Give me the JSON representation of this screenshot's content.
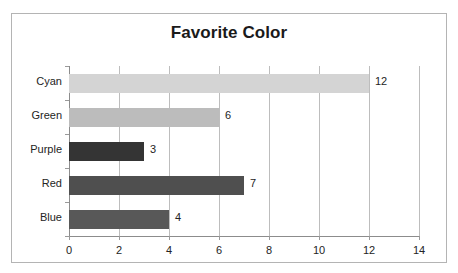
{
  "chart_data": {
    "type": "bar",
    "orientation": "horizontal",
    "title": "Favorite Color",
    "xlabel": "",
    "ylabel": "",
    "categories": [
      "Cyan",
      "Green",
      "Purple",
      "Red",
      "Blue"
    ],
    "values": [
      12,
      6,
      3,
      7,
      4
    ],
    "value_labels": [
      "12",
      "6",
      "3",
      "7",
      "4"
    ],
    "bar_colors": [
      "#d4d4d4",
      "#bcbcbc",
      "#343434",
      "#4f4f4f",
      "#585858"
    ],
    "xlim": [
      0,
      14
    ],
    "xticks": [
      0,
      2,
      4,
      6,
      8,
      10,
      12,
      14
    ],
    "xtick_labels": [
      "0",
      "2",
      "4",
      "6",
      "8",
      "10",
      "12",
      "14"
    ],
    "grid": true,
    "grid_axis": "x",
    "legend": false,
    "legend_position": "none"
  },
  "style": {
    "frame_border_color": "#b4b4b4",
    "gridline_color": "#bdbdbd",
    "axis_color": "#8c8c8c",
    "text_color": "#242424",
    "title_color": "#1a1a1a",
    "background": "#ffffff"
  }
}
